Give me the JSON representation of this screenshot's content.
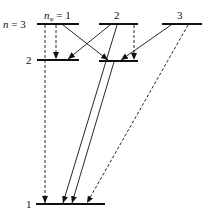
{
  "diagram": {
    "labels": {
      "n3": "n = 3",
      "n2": "2",
      "n1": "1",
      "nphi1": "nφ = 1",
      "nphi2": "2",
      "nphi3": "3"
    },
    "levels": [
      {
        "id": "n3-1",
        "x1": 37,
        "x2": 79,
        "y": 24
      },
      {
        "id": "n3-2",
        "x1": 99,
        "x2": 138,
        "y": 24
      },
      {
        "id": "n3-3",
        "x1": 162,
        "x2": 202,
        "y": 24
      },
      {
        "id": "n2-1",
        "x1": 37,
        "x2": 79,
        "y": 60
      },
      {
        "id": "n2-2",
        "x1": 99,
        "x2": 138,
        "y": 61
      },
      {
        "id": "n1-1",
        "x1": 36,
        "x2": 105,
        "y": 204
      }
    ],
    "transitions": [
      {
        "from": "n3-1",
        "to": "n2-1",
        "style": "dashed"
      },
      {
        "from": "n3-1",
        "to": "n2-2",
        "style": "solid"
      },
      {
        "from": "n3-1",
        "to": "n1-1",
        "style": "dashed"
      },
      {
        "from": "n3-2",
        "to": "n2-1",
        "style": "solid"
      },
      {
        "from": "n3-2",
        "to": "n2-2",
        "style": "dashed"
      },
      {
        "from": "n3-2",
        "to": "n1-1",
        "style": "solid"
      },
      {
        "from": "n3-3",
        "to": "n2-2",
        "style": "solid"
      },
      {
        "from": "n3-3",
        "to": "n1-1",
        "style": "dashed"
      },
      {
        "from": "n2-2",
        "to": "n1-1",
        "style": "solid"
      }
    ]
  }
}
